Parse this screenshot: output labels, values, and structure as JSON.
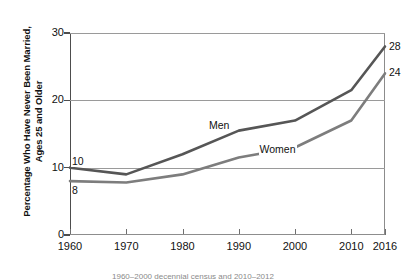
{
  "chart_data": {
    "type": "line",
    "title": "",
    "xlabel": "",
    "ylabel": "Percentage Who Have Never Been Married,\nAges 25 and Older",
    "categories": [
      "1960",
      "1970",
      "1980",
      "1990",
      "2000",
      "2010",
      "2016"
    ],
    "x": [
      1960,
      1970,
      1980,
      1990,
      2000,
      2010,
      2016
    ],
    "xlim": [
      1960,
      2016
    ],
    "ylim": [
      0,
      30
    ],
    "yticks": [
      "0",
      "10",
      "20",
      "30"
    ],
    "ytick_values": [
      0,
      10,
      20,
      30
    ],
    "grid": "horizontal",
    "legend_position": "inline-annotations",
    "series": [
      {
        "name": "Men",
        "color": "#565656",
        "values": [
          10,
          9,
          12,
          15.5,
          17,
          21.5,
          28
        ],
        "start_label": "10",
        "end_label": "28"
      },
      {
        "name": "Women",
        "color": "#7d7d7d",
        "values": [
          8,
          7.8,
          9,
          11.5,
          13,
          17,
          24
        ],
        "start_label": "8",
        "end_label": "24"
      }
    ],
    "annotations": [
      {
        "text": "Men",
        "x": 1987,
        "y": 16.2
      },
      {
        "text": "Women",
        "x": 1996,
        "y": 12.6
      },
      {
        "text": "10",
        "x": 1960,
        "y": 10.9
      },
      {
        "text": "8",
        "x": 1960,
        "y": 6.6
      },
      {
        "text": "28",
        "x": 2016,
        "y": 28
      },
      {
        "text": "24",
        "x": 2016,
        "y": 24
      }
    ]
  },
  "caption": {
    "text": "1960–2000 decennial census and 2010–2012"
  }
}
